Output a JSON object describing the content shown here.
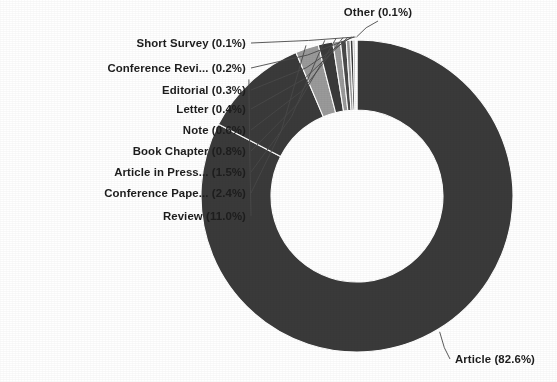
{
  "chart_data": {
    "type": "pie",
    "variant": "donut",
    "title": "",
    "subtitle": "",
    "xlabel": "",
    "ylabel": "",
    "legend_position": "none",
    "grid": false,
    "units": "percent",
    "start_angle_deg": 0,
    "direction": "clockwise",
    "inner_radius_ratio": 0.55,
    "categories": [
      "Article",
      "Review",
      "Conference Pape...",
      "Article in Press...",
      "Book Chapter",
      "Note",
      "Letter",
      "Editorial",
      "Conference Revi...",
      "Short Survey",
      "Other"
    ],
    "values": [
      82.6,
      11.0,
      2.4,
      1.5,
      0.8,
      0.6,
      0.4,
      0.3,
      0.2,
      0.1,
      0.1
    ],
    "labels": [
      "Article (82.6%)",
      "Review (11.0%)",
      "Conference Pape... (2.4%)",
      "Article in Press... (1.5%)",
      "Book Chapter (0.8%)",
      "Note (0.6%)",
      "Letter (0.4%)",
      "Editorial (0.3%)",
      "Conference Revi... (0.2%)",
      "Short Survey (0.1%)",
      "Other (0.1%)"
    ],
    "colors": [
      "#3a3a3a",
      "#3a3a3a",
      "#9a9a9a",
      "#3a3a3a",
      "#9a9a9a",
      "#4a4a4a",
      "#9a9a9a",
      "#3a3a3a",
      "#8f8f8f",
      "#4a4a4a",
      "#bdbdbd"
    ]
  },
  "geometry": {
    "center_x": 357,
    "center_y": 196,
    "outer_radius": 156,
    "inner_radius": 86
  },
  "style": {
    "background": "#ffffff",
    "dark_slice": "#3a3a3a",
    "light_slice": "#9a9a9a",
    "label_color": "#1d1d1d",
    "leader_color": "#4a4a4a"
  },
  "callouts": [
    {
      "key": "other",
      "label": "Other (0.1%)",
      "x": 378,
      "y": 16,
      "align": "middle"
    },
    {
      "key": "short-survey",
      "label": "Short Survey (0.1%)",
      "x": 246,
      "y": 47,
      "align": "end"
    },
    {
      "key": "conference-revi",
      "label": "Conference Revi... (0.2%)",
      "x": 246,
      "y": 72,
      "align": "end"
    },
    {
      "key": "editorial",
      "label": "Editorial (0.3%)",
      "x": 246,
      "y": 94,
      "align": "end"
    },
    {
      "key": "letter",
      "label": "Letter (0.4%)",
      "x": 246,
      "y": 113,
      "align": "end"
    },
    {
      "key": "note",
      "label": "Note (0.6%)",
      "x": 246,
      "y": 134,
      "align": "end"
    },
    {
      "key": "book-chapter",
      "label": "Book Chapter (0.8%)",
      "x": 246,
      "y": 155,
      "align": "end"
    },
    {
      "key": "article-in-press",
      "label": "Article in Press... (1.5%)",
      "x": 246,
      "y": 176,
      "align": "end"
    },
    {
      "key": "conference-pape",
      "label": "Conference Pape... (2.4%)",
      "x": 246,
      "y": 197,
      "align": "end"
    },
    {
      "key": "review",
      "label": "Review (11.0%)",
      "x": 246,
      "y": 220,
      "align": "end"
    },
    {
      "key": "article",
      "label": "Article (82.6%)",
      "x": 455,
      "y": 363,
      "align": "start"
    }
  ]
}
